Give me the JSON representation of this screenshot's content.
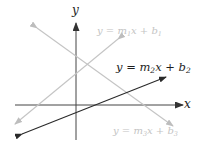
{
  "diagram": {
    "title": "",
    "axes": {
      "x_label": "x",
      "y_label": "y",
      "color": "#333333"
    },
    "lines": [
      {
        "id": "line1",
        "equation": {
          "pre": "y = m",
          "sub1": "1",
          "mid": "x + b",
          "sub2": "1"
        },
        "color": "#c8c8c8",
        "slope": "positive"
      },
      {
        "id": "line2",
        "equation": {
          "pre": "y = m",
          "sub1": "2",
          "mid": "x + b",
          "sub2": "2"
        },
        "color": "#2a2a2a",
        "slope": "positive"
      },
      {
        "id": "line3",
        "equation": {
          "pre": "y = m",
          "sub1": "3",
          "mid": "x + b",
          "sub2": "3"
        },
        "color": "#c8c8c8",
        "slope": "negative"
      }
    ]
  }
}
